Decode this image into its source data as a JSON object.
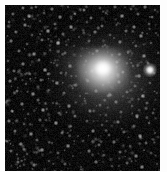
{
  "image": {
    "title": "Comet astrophotograph",
    "subject": "comet",
    "caption": "",
    "width": 167,
    "height": 172
  },
  "frame": {
    "background_color": "#ffffff",
    "sky_color": "#000000",
    "margin_left": 5,
    "margin_top": 5,
    "margin_right": 7,
    "margin_bottom": 1,
    "sky_width": 155,
    "sky_height": 166
  },
  "comet": {
    "label": "comet-coma",
    "nucleus_x": 101,
    "nucleus_y": 69,
    "peak_brightness": "#ffffff",
    "coma_color": "#e0e0e0",
    "tail_color": "#9a9a9a",
    "tail_direction": "lower-left"
  },
  "field": {
    "label": "star-field",
    "star_color": "#ffffff",
    "noise_color": "#1a1a1a",
    "star_count": 520
  },
  "bright_star": {
    "label": "field-star",
    "x": 145,
    "y": 65,
    "color": "#ffffff"
  },
  "stars": [
    [
      18,
      3,
      1.0,
      0.62
    ],
    [
      31,
      2,
      0.9,
      0.5
    ],
    [
      47,
      4,
      1.1,
      0.58
    ],
    [
      63,
      2,
      0.8,
      0.44
    ],
    [
      79,
      5,
      1.0,
      0.66
    ],
    [
      95,
      3,
      0.9,
      0.4
    ],
    [
      110,
      2,
      1.0,
      0.52
    ],
    [
      126,
      4,
      0.9,
      0.48
    ],
    [
      140,
      2,
      1.1,
      0.6
    ],
    [
      150,
      5,
      0.8,
      0.42
    ],
    [
      8,
      9,
      1.0,
      0.55
    ],
    [
      24,
      11,
      1.2,
      0.7
    ],
    [
      39,
      8,
      0.9,
      0.46
    ],
    [
      55,
      12,
      1.1,
      0.64
    ],
    [
      70,
      9,
      0.8,
      0.38
    ],
    [
      86,
      13,
      1.0,
      0.58
    ],
    [
      101,
      8,
      0.9,
      0.44
    ],
    [
      117,
      11,
      1.2,
      0.72
    ],
    [
      133,
      9,
      1.0,
      0.5
    ],
    [
      147,
      12,
      0.9,
      0.56
    ],
    [
      4,
      17,
      0.9,
      0.48
    ],
    [
      20,
      20,
      1.1,
      0.66
    ],
    [
      35,
      16,
      0.8,
      0.4
    ],
    [
      50,
      19,
      1.0,
      0.54
    ],
    [
      66,
      22,
      1.2,
      0.74
    ],
    [
      82,
      17,
      0.9,
      0.42
    ],
    [
      97,
      21,
      1.0,
      0.6
    ],
    [
      113,
      18,
      0.8,
      0.36
    ],
    [
      129,
      22,
      1.1,
      0.68
    ],
    [
      144,
      19,
      0.9,
      0.5
    ],
    [
      11,
      27,
      1.0,
      0.56
    ],
    [
      27,
      30,
      0.9,
      0.44
    ],
    [
      43,
      26,
      1.2,
      0.76
    ],
    [
      58,
      29,
      1.0,
      0.52
    ],
    [
      74,
      32,
      0.8,
      0.38
    ],
    [
      90,
      27,
      1.1,
      0.64
    ],
    [
      105,
      30,
      0.9,
      0.46
    ],
    [
      121,
      26,
      1.0,
      0.58
    ],
    [
      136,
      31,
      1.2,
      0.7
    ],
    [
      151,
      28,
      0.8,
      0.4
    ],
    [
      6,
      36,
      1.1,
      0.62
    ],
    [
      22,
      39,
      0.9,
      0.46
    ],
    [
      37,
      35,
      1.0,
      0.54
    ],
    [
      53,
      38,
      1.2,
      0.78
    ],
    [
      69,
      41,
      0.8,
      0.36
    ],
    [
      84,
      36,
      1.0,
      0.5
    ],
    [
      100,
      40,
      0.9,
      0.44
    ],
    [
      115,
      37,
      1.1,
      0.66
    ],
    [
      131,
      41,
      1.0,
      0.52
    ],
    [
      146,
      38,
      0.9,
      0.48
    ],
    [
      14,
      46,
      1.0,
      0.58
    ],
    [
      29,
      49,
      1.2,
      0.72
    ],
    [
      45,
      45,
      0.9,
      0.42
    ],
    [
      60,
      48,
      1.0,
      0.56
    ],
    [
      76,
      51,
      0.8,
      0.34
    ],
    [
      92,
      46,
      1.1,
      0.62
    ],
    [
      107,
      50,
      0.9,
      0.46
    ],
    [
      123,
      47,
      1.0,
      0.54
    ],
    [
      139,
      51,
      1.2,
      0.74
    ],
    [
      153,
      48,
      0.8,
      0.38
    ],
    [
      3,
      56,
      0.9,
      0.44
    ],
    [
      18,
      59,
      1.1,
      0.64
    ],
    [
      34,
      55,
      1.0,
      0.52
    ],
    [
      49,
      58,
      0.8,
      0.36
    ],
    [
      65,
      61,
      1.2,
      0.7
    ],
    [
      81,
      56,
      0.9,
      0.4
    ],
    [
      96,
      60,
      1.0,
      0.48
    ],
    [
      112,
      57,
      1.1,
      0.6
    ],
    [
      128,
      61,
      0.9,
      0.44
    ],
    [
      143,
      58,
      1.0,
      0.54
    ],
    [
      9,
      66,
      1.0,
      0.56
    ],
    [
      25,
      69,
      0.9,
      0.42
    ],
    [
      40,
      65,
      1.2,
      0.74
    ],
    [
      56,
      68,
      1.0,
      0.5
    ],
    [
      71,
      71,
      0.8,
      0.34
    ],
    [
      87,
      66,
      1.1,
      0.58
    ],
    [
      103,
      70,
      0.9,
      0.38
    ],
    [
      118,
      67,
      1.0,
      0.52
    ],
    [
      134,
      71,
      1.2,
      0.68
    ],
    [
      149,
      68,
      0.9,
      0.46
    ],
    [
      5,
      76,
      1.1,
      0.6
    ],
    [
      21,
      79,
      0.9,
      0.44
    ],
    [
      36,
      75,
      1.0,
      0.54
    ],
    [
      52,
      78,
      1.2,
      0.72
    ],
    [
      67,
      81,
      0.8,
      0.36
    ],
    [
      83,
      76,
      1.0,
      0.48
    ],
    [
      98,
      80,
      0.9,
      0.4
    ],
    [
      114,
      77,
      1.1,
      0.62
    ],
    [
      130,
      81,
      1.0,
      0.5
    ],
    [
      145,
      78,
      0.9,
      0.46
    ],
    [
      12,
      86,
      1.0,
      0.58
    ],
    [
      28,
      89,
      1.2,
      0.7
    ],
    [
      44,
      85,
      0.9,
      0.42
    ],
    [
      59,
      88,
      1.0,
      0.56
    ],
    [
      75,
      91,
      0.8,
      0.34
    ],
    [
      91,
      86,
      1.1,
      0.64
    ],
    [
      106,
      90,
      0.9,
      0.44
    ],
    [
      122,
      87,
      1.0,
      0.52
    ],
    [
      138,
      91,
      1.2,
      0.76
    ],
    [
      152,
      88,
      0.8,
      0.38
    ],
    [
      2,
      96,
      0.9,
      0.46
    ],
    [
      17,
      99,
      1.1,
      0.62
    ],
    [
      33,
      95,
      1.0,
      0.5
    ],
    [
      48,
      98,
      0.8,
      0.36
    ],
    [
      64,
      101,
      1.2,
      0.72
    ],
    [
      80,
      96,
      0.9,
      0.42
    ],
    [
      95,
      100,
      1.0,
      0.54
    ],
    [
      111,
      97,
      1.1,
      0.6
    ],
    [
      127,
      101,
      0.9,
      0.44
    ],
    [
      142,
      98,
      1.0,
      0.52
    ],
    [
      7,
      106,
      1.0,
      0.56
    ],
    [
      23,
      109,
      0.9,
      0.4
    ],
    [
      38,
      105,
      1.2,
      0.74
    ],
    [
      54,
      108,
      1.0,
      0.48
    ],
    [
      70,
      111,
      0.8,
      0.34
    ],
    [
      85,
      106,
      1.1,
      0.62
    ],
    [
      101,
      110,
      0.9,
      0.44
    ],
    [
      116,
      107,
      1.0,
      0.5
    ],
    [
      132,
      111,
      1.2,
      0.7
    ],
    [
      148,
      108,
      0.9,
      0.48
    ],
    [
      4,
      116,
      1.1,
      0.6
    ],
    [
      19,
      119,
      0.9,
      0.44
    ],
    [
      35,
      115,
      1.0,
      0.52
    ],
    [
      51,
      118,
      1.2,
      0.76
    ],
    [
      66,
      121,
      0.8,
      0.36
    ],
    [
      82,
      116,
      1.0,
      0.46
    ],
    [
      97,
      120,
      0.9,
      0.42
    ],
    [
      113,
      117,
      1.1,
      0.64
    ],
    [
      129,
      121,
      1.0,
      0.5
    ],
    [
      144,
      118,
      0.9,
      0.54
    ],
    [
      10,
      126,
      1.0,
      0.58
    ],
    [
      26,
      129,
      1.2,
      0.72
    ],
    [
      41,
      125,
      0.9,
      0.4
    ],
    [
      57,
      128,
      1.0,
      0.54
    ],
    [
      73,
      131,
      0.8,
      0.32
    ],
    [
      88,
      126,
      1.1,
      0.66
    ],
    [
      104,
      130,
      0.9,
      0.46
    ],
    [
      119,
      127,
      1.0,
      0.52
    ],
    [
      135,
      131,
      1.2,
      0.74
    ],
    [
      150,
      128,
      0.8,
      0.38
    ],
    [
      1,
      136,
      0.9,
      0.44
    ],
    [
      16,
      139,
      1.1,
      0.64
    ],
    [
      32,
      135,
      1.0,
      0.5
    ],
    [
      47,
      138,
      0.8,
      0.34
    ],
    [
      63,
      141,
      1.2,
      0.7
    ],
    [
      78,
      136,
      0.9,
      0.42
    ],
    [
      94,
      140,
      1.0,
      0.56
    ],
    [
      109,
      137,
      1.1,
      0.58
    ],
    [
      125,
      141,
      0.9,
      0.44
    ],
    [
      141,
      138,
      1.0,
      0.52
    ],
    [
      6,
      146,
      1.0,
      0.56
    ],
    [
      22,
      149,
      0.9,
      0.42
    ],
    [
      37,
      145,
      1.2,
      0.72
    ],
    [
      53,
      148,
      1.0,
      0.48
    ],
    [
      68,
      151,
      0.8,
      0.36
    ],
    [
      84,
      146,
      1.1,
      0.6
    ],
    [
      99,
      150,
      0.9,
      0.44
    ],
    [
      115,
      147,
      1.0,
      0.54
    ],
    [
      131,
      151,
      1.2,
      0.68
    ],
    [
      146,
      148,
      0.9,
      0.46
    ],
    [
      13,
      157,
      1.0,
      0.54
    ],
    [
      29,
      160,
      1.1,
      0.62
    ],
    [
      44,
      156,
      0.9,
      0.4
    ],
    [
      60,
      159,
      1.0,
      0.5
    ],
    [
      76,
      162,
      0.8,
      0.34
    ],
    [
      91,
      157,
      1.1,
      0.58
    ],
    [
      107,
      161,
      0.9,
      0.42
    ],
    [
      122,
      158,
      1.0,
      0.52
    ],
    [
      137,
      162,
      1.2,
      0.66
    ],
    [
      152,
      159,
      0.8,
      0.38
    ]
  ]
}
